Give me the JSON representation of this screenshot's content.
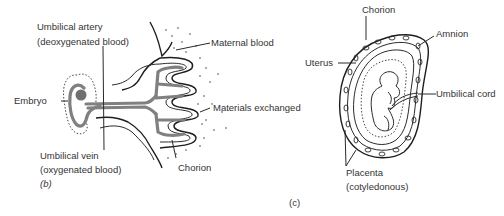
{
  "diagram_b": {
    "panel_label": "(b)",
    "labels": {
      "umbilical_artery_line1": "Umbilical artery",
      "umbilical_artery_line2": "(deoxygenated blood)",
      "embryo": "Embryo",
      "umbilical_vein_line1": "Umbilical vein",
      "umbilical_vein_line2": "(oxygenated blood)",
      "maternal_blood": "Maternal blood",
      "materials_exchanged": "Materials exchanged",
      "chorion": "Chorion"
    }
  },
  "diagram_c": {
    "panel_label": "(c)",
    "labels": {
      "chorion": "Chorion",
      "amnion": "Amnion",
      "uterus": "Uterus",
      "umbilical_cord": "Umbilical cord",
      "placenta_line1": "Placenta",
      "placenta_line2": "(cotyledonous)"
    }
  }
}
